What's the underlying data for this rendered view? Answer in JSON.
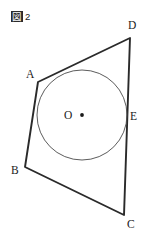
{
  "figure": {
    "caption_kanji": "図",
    "caption_number": "2",
    "caption_full": "図 2",
    "type": "geometry-diagram"
  },
  "colors": {
    "background": "#ffffff",
    "polygon_stroke": "#2a2a2a",
    "circle_stroke": "#4a4a4a",
    "label_text": "#1a1a1a",
    "caption_box_fill": "#2b2b2b",
    "caption_box_text": "#ffffff"
  },
  "geometry": {
    "canvas": {
      "width": 147,
      "height": 240
    },
    "polygon": {
      "name": "quadrilateral-ABCD",
      "closed": true,
      "vertices": [
        {
          "id": "A",
          "x": 38,
          "y": 82
        },
        {
          "id": "D",
          "x": 130,
          "y": 38
        },
        {
          "id": "C",
          "x": 124,
          "y": 215
        },
        {
          "id": "B",
          "x": 25,
          "y": 167
        }
      ]
    },
    "circle": {
      "name": "inscribed-circle",
      "center": {
        "id": "O",
        "x": 82,
        "y": 115
      },
      "radius": 45
    },
    "points": [
      {
        "id": "A",
        "x": 38,
        "y": 82,
        "label": "A",
        "label_x": 26,
        "label_y": 68
      },
      {
        "id": "B",
        "x": 25,
        "y": 167,
        "label": "B",
        "label_x": 11,
        "label_y": 164
      },
      {
        "id": "C",
        "x": 124,
        "y": 215,
        "label": "C",
        "label_x": 127,
        "label_y": 218
      },
      {
        "id": "D",
        "x": 130,
        "y": 38,
        "label": "D",
        "label_x": 128,
        "label_y": 19
      },
      {
        "id": "E",
        "x": 127,
        "y": 117,
        "label": "E",
        "label_x": 130,
        "label_y": 110
      },
      {
        "id": "O",
        "x": 82,
        "y": 115,
        "label": "O",
        "label_x": 64,
        "label_y": 109
      }
    ]
  }
}
